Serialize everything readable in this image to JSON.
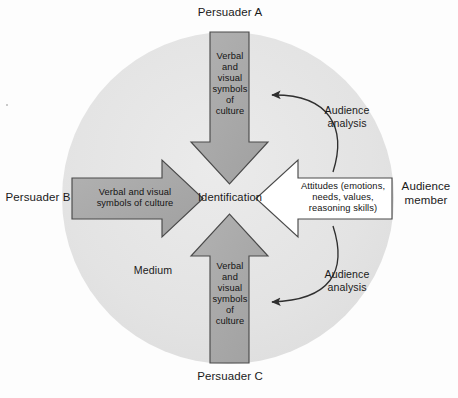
{
  "diagram": {
    "title_caption": "",
    "colors": {
      "page_background": "#fdfdfd",
      "medium_circle": "#e4e4e4",
      "persuader_arrow_fill": "#a9a9a9",
      "audience_arrow_fill": "#ffffff",
      "stroke": "#3a3a3a",
      "text": "#1a1a1a"
    },
    "circle": {
      "label": "Medium",
      "center_x": 228,
      "center_y": 198,
      "radius": 166
    },
    "center": {
      "label": "Identification"
    },
    "nodes": [
      {
        "id": "persuader-a",
        "label": "Persuader A",
        "position": "top",
        "arrow_direction": "down",
        "arrow_fill": "#a9a9a9",
        "arrow_text": "Verbal\nand\nvisual\nsymbols\nof\nculture"
      },
      {
        "id": "persuader-b",
        "label": "Persuader B",
        "position": "left",
        "arrow_direction": "right",
        "arrow_fill": "#a9a9a9",
        "arrow_text": "Verbal and visual\nsymbols of culture"
      },
      {
        "id": "persuader-c",
        "label": "Persuader C",
        "position": "bottom",
        "arrow_direction": "up",
        "arrow_fill": "#a9a9a9",
        "arrow_text": "Verbal\nand\nvisual\nsymbols\nof\nculture"
      },
      {
        "id": "audience-member",
        "label": "Audience\nmember",
        "position": "right",
        "arrow_direction": "left",
        "arrow_fill": "#ffffff",
        "arrow_text": "Attitudes (emotions,\nneeds, values,\nreasoning skills)"
      }
    ],
    "feedback_arrows": [
      {
        "id": "audience-analysis-upper",
        "label": "Audience\nanalysis",
        "from": "audience-member",
        "to": "persuader-a"
      },
      {
        "id": "audience-analysis-lower",
        "label": "Audience\nanalysis",
        "from": "audience-member",
        "to": "persuader-c"
      }
    ]
  }
}
